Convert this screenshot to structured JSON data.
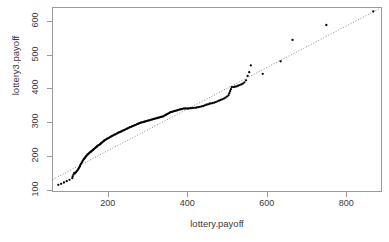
{
  "chart_data": {
    "type": "scatter",
    "title": "",
    "xlabel": "lottery.payoff",
    "ylabel": "lottery3.payoff",
    "xlim": [
      60,
      890
    ],
    "ylim": [
      95,
      640
    ],
    "xticks": [
      200,
      400,
      600,
      800
    ],
    "yticks": [
      100,
      200,
      300,
      400,
      500,
      600
    ],
    "grid": false,
    "legend": null,
    "point_color": "#000000",
    "point_size": 1.6,
    "refline": {
      "style": "dotted",
      "color": "#7d7d7d",
      "x": [
        62,
        885
      ],
      "y": [
        132,
        636
      ],
      "description": "qq reference line through quartiles"
    },
    "series": [
      {
        "name": "quantile pairs",
        "points": [
          [
            76,
            116
          ],
          [
            83,
            119
          ],
          [
            90,
            123
          ],
          [
            97,
            127
          ],
          [
            104,
            131
          ],
          [
            111,
            136
          ],
          [
            112,
            141
          ],
          [
            114,
            146
          ],
          [
            116,
            151
          ],
          [
            118,
            150
          ],
          [
            120,
            153
          ],
          [
            122,
            156
          ],
          [
            124,
            159
          ],
          [
            126,
            162
          ],
          [
            128,
            166
          ],
          [
            130,
            170
          ],
          [
            131,
            174
          ],
          [
            133,
            178
          ],
          [
            135,
            182
          ],
          [
            137,
            186
          ],
          [
            139,
            190
          ],
          [
            141,
            193
          ],
          [
            143,
            196
          ],
          [
            145,
            199
          ],
          [
            147,
            202
          ],
          [
            149,
            205
          ],
          [
            151,
            207
          ],
          [
            153,
            209
          ],
          [
            155,
            211
          ],
          [
            157,
            213
          ],
          [
            159,
            215
          ],
          [
            161,
            217
          ],
          [
            163,
            219
          ],
          [
            165,
            221
          ],
          [
            167,
            223
          ],
          [
            169,
            225
          ],
          [
            171,
            227
          ],
          [
            173,
            229
          ],
          [
            175,
            231
          ],
          [
            177,
            233
          ],
          [
            179,
            234
          ],
          [
            181,
            236
          ],
          [
            183,
            238
          ],
          [
            185,
            240
          ],
          [
            187,
            242
          ],
          [
            189,
            244
          ],
          [
            191,
            246
          ],
          [
            193,
            248
          ],
          [
            196,
            250
          ],
          [
            199,
            252
          ],
          [
            202,
            254
          ],
          [
            205,
            256
          ],
          [
            208,
            258
          ],
          [
            211,
            260
          ],
          [
            214,
            262
          ],
          [
            217,
            264
          ],
          [
            220,
            265
          ],
          [
            223,
            267
          ],
          [
            226,
            269
          ],
          [
            229,
            271
          ],
          [
            232,
            272
          ],
          [
            235,
            274
          ],
          [
            238,
            276
          ],
          [
            241,
            277
          ],
          [
            244,
            279
          ],
          [
            247,
            281
          ],
          [
            250,
            282
          ],
          [
            253,
            284
          ],
          [
            256,
            286
          ],
          [
            259,
            287
          ],
          [
            262,
            289
          ],
          [
            265,
            290
          ],
          [
            268,
            292
          ],
          [
            271,
            293
          ],
          [
            274,
            295
          ],
          [
            277,
            296
          ],
          [
            280,
            298
          ],
          [
            283,
            299
          ],
          [
            286,
            300
          ],
          [
            289,
            301
          ],
          [
            292,
            302
          ],
          [
            295,
            303
          ],
          [
            298,
            304
          ],
          [
            301,
            305
          ],
          [
            304,
            306
          ],
          [
            307,
            307
          ],
          [
            310,
            308
          ],
          [
            313,
            309
          ],
          [
            316,
            310
          ],
          [
            319,
            311
          ],
          [
            322,
            312
          ],
          [
            325,
            313
          ],
          [
            328,
            314
          ],
          [
            331,
            315
          ],
          [
            334,
            316
          ],
          [
            337,
            317
          ],
          [
            340,
            318
          ],
          [
            343,
            320
          ],
          [
            346,
            322
          ],
          [
            349,
            324
          ],
          [
            352,
            326
          ],
          [
            355,
            328
          ],
          [
            358,
            330
          ],
          [
            361,
            331
          ],
          [
            364,
            332
          ],
          [
            367,
            333
          ],
          [
            370,
            334
          ],
          [
            373,
            335
          ],
          [
            376,
            336
          ],
          [
            379,
            337
          ],
          [
            382,
            338
          ],
          [
            385,
            339
          ],
          [
            388,
            340
          ],
          [
            392,
            341
          ],
          [
            396,
            341
          ],
          [
            400,
            341
          ],
          [
            404,
            341
          ],
          [
            408,
            342
          ],
          [
            412,
            342
          ],
          [
            416,
            343
          ],
          [
            420,
            343
          ],
          [
            424,
            344
          ],
          [
            428,
            345
          ],
          [
            432,
            346
          ],
          [
            436,
            347
          ],
          [
            440,
            348
          ],
          [
            444,
            350
          ],
          [
            448,
            352
          ],
          [
            452,
            353
          ],
          [
            456,
            355
          ],
          [
            460,
            356
          ],
          [
            464,
            357
          ],
          [
            468,
            358
          ],
          [
            472,
            360
          ],
          [
            476,
            362
          ],
          [
            480,
            364
          ],
          [
            484,
            366
          ],
          [
            488,
            368
          ],
          [
            492,
            370
          ],
          [
            496,
            373
          ],
          [
            500,
            376
          ],
          [
            504,
            380
          ],
          [
            506,
            386
          ],
          [
            508,
            392
          ],
          [
            510,
            398
          ],
          [
            512,
            404
          ],
          [
            516,
            404
          ],
          [
            520,
            405
          ],
          [
            524,
            406
          ],
          [
            528,
            408
          ],
          [
            532,
            410
          ],
          [
            536,
            412
          ],
          [
            540,
            414
          ],
          [
            544,
            418
          ],
          [
            548,
            424
          ],
          [
            552,
            437
          ],
          [
            556,
            448
          ],
          [
            560,
            468
          ],
          [
            590,
            443
          ],
          [
            635,
            480
          ],
          [
            665,
            543
          ],
          [
            750,
            587
          ],
          [
            868,
            627
          ]
        ]
      }
    ]
  },
  "axis": {
    "y_tick_labels": [
      "100",
      "200",
      "300",
      "400",
      "500",
      "600"
    ],
    "x_tick_labels": [
      "200",
      "400",
      "600",
      "800"
    ]
  }
}
